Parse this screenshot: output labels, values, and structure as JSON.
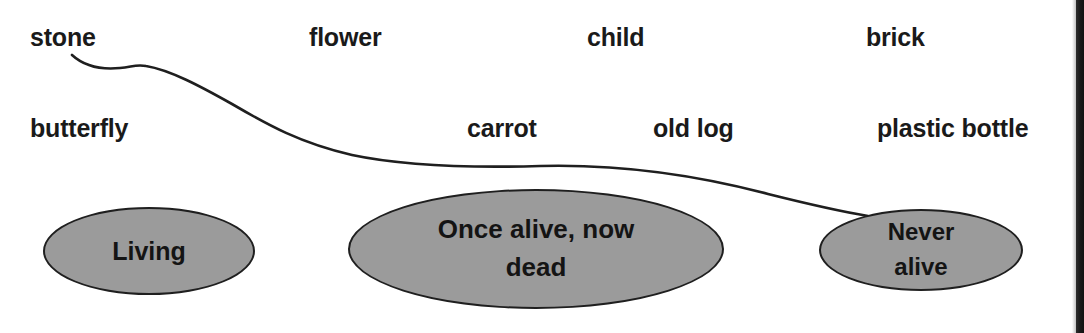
{
  "worksheet": {
    "title": "Living, Once alive now dead, Never alive sorting activity",
    "background_color": "#ffffff",
    "ink_color": "#1a1a1a",
    "ellipse_fill_color": "#9b9b9b",
    "ellipse_border_color": "#1f1f1f"
  },
  "words": [
    {
      "id": "word-stone",
      "label": "stone",
      "x": 30,
      "y": 24,
      "row": 1
    },
    {
      "id": "word-flower",
      "label": "flower",
      "x": 309,
      "y": 24,
      "row": 1
    },
    {
      "id": "word-child",
      "label": "child",
      "x": 587,
      "y": 24,
      "row": 1
    },
    {
      "id": "word-brick",
      "label": "brick",
      "x": 866,
      "y": 24,
      "row": 1
    },
    {
      "id": "word-butterfly",
      "label": "butterfly",
      "x": 30,
      "y": 115,
      "row": 2
    },
    {
      "id": "word-carrot",
      "label": "carrot",
      "x": 467,
      "y": 115,
      "row": 2
    },
    {
      "id": "word-old-log",
      "label": "old log",
      "x": 653,
      "y": 115,
      "row": 2
    },
    {
      "id": "word-plastic-bottle",
      "label": "plastic bottle",
      "x": 877,
      "y": 115,
      "row": 2
    }
  ],
  "categories": [
    {
      "id": "ellipse-living",
      "label": "Living",
      "x": 43,
      "y": 207,
      "width": 212,
      "height": 88
    },
    {
      "id": "ellipse-once-alive",
      "label": "Once alive, now\ndead",
      "x": 348,
      "y": 189,
      "width": 376,
      "height": 120
    },
    {
      "id": "ellipse-never-alive",
      "label": "Never\nalive",
      "x": 819,
      "y": 209,
      "width": 204,
      "height": 82
    }
  ],
  "connector": {
    "id": "connector-stone-to-never-alive",
    "from_word": "stone",
    "to_category": "Never alive",
    "stroke_color": "#1f1f1f",
    "stroke_width": 2.6,
    "path": "M 72 55 C 84 66, 100 70, 120 68 C 132 67, 136 64, 146 66 C 170 70, 200 86, 232 104 C 268 125, 300 143, 352 155 C 404 166, 470 168, 540 166 C 620 164, 700 176, 768 194 C 812 205, 844 212, 868 216"
  }
}
